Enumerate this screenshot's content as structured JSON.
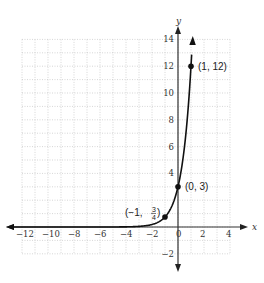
{
  "chart_data": {
    "type": "line",
    "title": "",
    "xlabel": "x",
    "ylabel": "y",
    "xlim": [
      -12,
      4
    ],
    "ylim": [
      -2,
      14
    ],
    "grid": true,
    "x_ticks": [
      "-12",
      "-10",
      "-8",
      "-6",
      "-4",
      "-2",
      "0",
      "2",
      "4"
    ],
    "y_ticks": [
      "-2",
      "4",
      "6",
      "8",
      "10",
      "12",
      "14"
    ],
    "function": "y = 3 * 4^x",
    "series": [
      {
        "name": "y = 3·4^x",
        "x": [
          -12,
          -4,
          -3,
          -2,
          -1,
          0,
          0.5,
          1,
          1.09
        ],
        "y": [
          0,
          0.01,
          0.05,
          0.19,
          0.75,
          3,
          6,
          12,
          13.9
        ]
      }
    ],
    "points": [
      {
        "x": -1,
        "y": 0.75,
        "label_prefix": "(−1, ",
        "num": "3",
        "den": "4",
        "label_suffix": ")"
      },
      {
        "x": 0,
        "y": 3,
        "label": "(0, 3)"
      },
      {
        "x": 1,
        "y": 12,
        "label": "(1, 12)"
      }
    ]
  }
}
